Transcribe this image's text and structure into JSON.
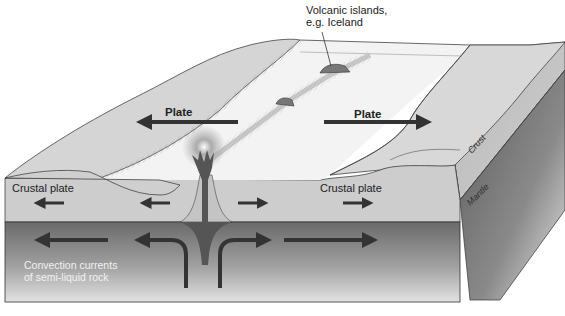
{
  "diagram": {
    "type": "block-diagram",
    "labels": {
      "callout": "Volcanic islands,\ne.g. Iceland",
      "callout_line1": "Volcanic islands,",
      "callout_line2": "e.g. Iceland",
      "plate_left": "Plate",
      "plate_right": "Plate",
      "crustal_plate_left": "Crustal plate",
      "crustal_plate_right": "Crustal plate",
      "convection_line1": "Convection currents",
      "convection_line2": "of semi-liquid rock",
      "side_crust": "Crust",
      "side_mantle": "Mantle"
    },
    "arrows": [
      {
        "name": "plate-left-arrow",
        "direction": "left"
      },
      {
        "name": "plate-right-arrow",
        "direction": "right"
      },
      {
        "name": "crust-arrow-1",
        "direction": "left"
      },
      {
        "name": "crust-arrow-2",
        "direction": "left"
      },
      {
        "name": "crust-arrow-3",
        "direction": "right"
      },
      {
        "name": "crust-arrow-4",
        "direction": "right"
      },
      {
        "name": "mantle-arrow-1",
        "direction": "left"
      },
      {
        "name": "mantle-arrow-2",
        "direction": "up-then-left"
      },
      {
        "name": "mantle-arrow-3",
        "direction": "up-then-right"
      },
      {
        "name": "mantle-arrow-4",
        "direction": "right"
      }
    ],
    "colors": {
      "crust_front": "#cfcfcf",
      "mantle_dark": "#6a6a6a",
      "mantle_light": "#d8d8d8",
      "top_surface": "#d6d6d6",
      "rift_valley": "#f2f2f2",
      "arrow": "#333333",
      "magma": "#555555"
    }
  }
}
